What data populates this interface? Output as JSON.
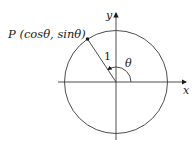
{
  "diagram": {
    "point_label": "P (cosθ, sinθ)",
    "radius_label": "1",
    "angle_label": "θ",
    "x_axis_label": "x",
    "y_axis_label": "y",
    "colors": {
      "stroke": "#3a3a3a",
      "text": "#1a1a1a",
      "background": "#ffffff"
    }
  }
}
